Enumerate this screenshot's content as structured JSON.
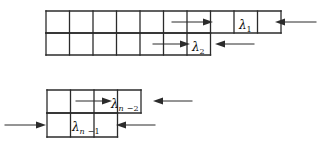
{
  "figure": {
    "type": "young-diagram-hook-lengths",
    "background_color": "#ffffff",
    "line_color": "#2b2b2b",
    "text_color": "#111111",
    "diagrams": [
      {
        "name": "upper-diagram",
        "rows": [
          {
            "cells": 10,
            "x0": 46,
            "y0": 11,
            "cell_w": 23.5,
            "cell_h": 22
          },
          {
            "cells": 7,
            "x0": 46,
            "y0": 33,
            "cell_w": 23.5,
            "cell_h": 22
          }
        ],
        "labels": [
          {
            "name": "lambda-1",
            "base": "λ",
            "sub": "1",
            "tail": "",
            "x": 239,
            "y": 16
          },
          {
            "name": "lambda-2",
            "base": "λ",
            "sub": "2",
            "tail": "",
            "x": 192,
            "y": 38
          }
        ],
        "arrows": [
          {
            "name": "arrow-right-row1",
            "dir": "right",
            "x1": 172,
            "x2": 213,
            "y": 22
          },
          {
            "name": "arrow-left-row1",
            "dir": "left",
            "x1": 316,
            "x2": 275,
            "y": 22
          },
          {
            "name": "arrow-right-row2",
            "dir": "right",
            "x1": 153,
            "x2": 190,
            "y": 44
          },
          {
            "name": "arrow-left-row2",
            "dir": "left",
            "x1": 254,
            "x2": 215,
            "y": 44
          }
        ]
      },
      {
        "name": "lower-diagram",
        "rows": [
          {
            "cells": 4,
            "x0": 47,
            "y0": 90,
            "cell_w": 23.5,
            "cell_h": 23
          },
          {
            "cells": 3,
            "x0": 47,
            "y0": 113,
            "cell_w": 23.5,
            "cell_h": 24
          }
        ],
        "labels": [
          {
            "name": "lambda-n-minus-2",
            "base": "λ",
            "sub": "n",
            "tail": "−2",
            "x": 111,
            "y": 95
          },
          {
            "name": "lambda-n-minus-1",
            "base": "λ",
            "sub": "n",
            "tail": "−1",
            "x": 72,
            "y": 118
          }
        ],
        "arrows": [
          {
            "name": "arrow-right-rowtop",
            "dir": "right",
            "x1": 76,
            "x2": 112,
            "y": 101
          },
          {
            "name": "arrow-left-rowtop",
            "dir": "left",
            "x1": 192,
            "x2": 153,
            "y": 101
          },
          {
            "name": "arrow-right-rowbot",
            "dir": "right",
            "x1": 5,
            "x2": 46,
            "y": 125
          },
          {
            "name": "arrow-left-rowbot",
            "dir": "left",
            "x1": 155,
            "x2": 116,
            "y": 125
          }
        ]
      }
    ]
  }
}
